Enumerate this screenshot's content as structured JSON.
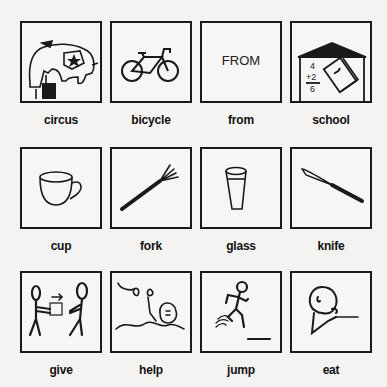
{
  "symbols": [
    {
      "id": "circus",
      "label": "circus",
      "icon": "elephant-icon"
    },
    {
      "id": "bicycle",
      "label": "bicycle",
      "icon": "bicycle-icon"
    },
    {
      "id": "from",
      "label": "from",
      "icon": "text-from",
      "text": "FROM"
    },
    {
      "id": "school",
      "label": "school",
      "icon": "school-icon",
      "math": [
        "4",
        "+2",
        "6"
      ]
    },
    {
      "id": "cup",
      "label": "cup",
      "icon": "cup-icon"
    },
    {
      "id": "fork",
      "label": "fork",
      "icon": "fork-icon"
    },
    {
      "id": "glass",
      "label": "glass",
      "icon": "glass-icon"
    },
    {
      "id": "knife",
      "label": "knife",
      "icon": "knife-icon"
    },
    {
      "id": "give",
      "label": "give",
      "icon": "give-icon"
    },
    {
      "id": "help",
      "label": "help",
      "icon": "help-icon"
    },
    {
      "id": "jump",
      "label": "jump",
      "icon": "jump-icon"
    },
    {
      "id": "eat",
      "label": "eat",
      "icon": "eat-icon"
    }
  ],
  "colors": {
    "ink": "#1a1a1a",
    "paper": "#f4f3f1"
  }
}
